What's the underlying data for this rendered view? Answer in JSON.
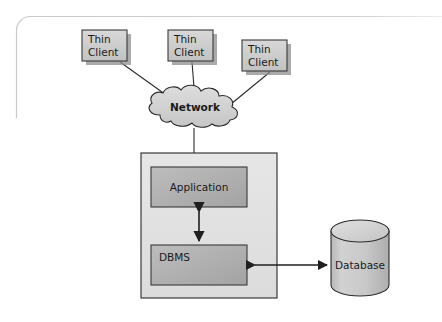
{
  "figure": {
    "kind": "architecture-diagram",
    "background_color": "#ffffff",
    "frame": {
      "name": "page-frame",
      "stroke_color": "#c9c9c9"
    }
  },
  "palette": {
    "box_fill_light": "#cfcfcf",
    "box_fill_dark": "#b0b0b0",
    "container_fill": "#e2e2e2",
    "cloud_fill": "#d4d4d4",
    "cylinder_fill": "#c6c6c6",
    "cylinder_top_fill": "#d8d8d8",
    "outline": "#3a3a3a",
    "shadow": "#8e8e8e",
    "text": "#1a1a1a"
  },
  "clients": [
    {
      "id": "thin-client-1",
      "line1": "Thin",
      "line2": "Client"
    },
    {
      "id": "thin-client-2",
      "line1": "Thin",
      "line2": "Client"
    },
    {
      "id": "thin-client-3",
      "line1": "Thin",
      "line2": "Client"
    }
  ],
  "network": {
    "label": "Network"
  },
  "server": {
    "label": "",
    "application": {
      "label": "Application"
    },
    "dbms": {
      "label": "DBMS"
    }
  },
  "database": {
    "label": "Database"
  },
  "connectors": [
    {
      "id": "client1-to-network",
      "type": "line",
      "arrows": "none"
    },
    {
      "id": "client2-to-network",
      "type": "line",
      "arrows": "none"
    },
    {
      "id": "client3-to-network",
      "type": "line",
      "arrows": "none"
    },
    {
      "id": "network-to-server",
      "type": "line",
      "arrows": "none"
    },
    {
      "id": "application-to-dbms",
      "type": "line",
      "arrows": "both"
    },
    {
      "id": "dbms-to-database",
      "type": "line",
      "arrows": "both"
    }
  ]
}
